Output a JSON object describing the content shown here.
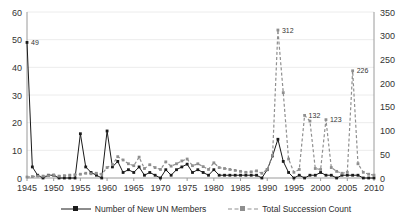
{
  "chart_data": {
    "type": "line",
    "title": "",
    "xlabel": "",
    "ylabel": "",
    "grid": true,
    "legend_position": "bottom",
    "x_axis": {
      "min": 1945,
      "max": 2010,
      "tick_step": 5,
      "tick_labels": [
        "1945",
        "1950",
        "1955",
        "1960",
        "1965",
        "1970",
        "1975",
        "1980",
        "1985",
        "1990",
        "1995",
        "2000",
        "2005",
        "2010"
      ]
    },
    "y_axis_left": {
      "min": 0,
      "max": 60,
      "tick_step": 10,
      "tick_labels": [
        "0",
        "10",
        "20",
        "30",
        "40",
        "50",
        "60"
      ],
      "series_name": "Number of New UN Members"
    },
    "y_axis_right": {
      "min": 0,
      "max": 350,
      "tick_step": 50,
      "tick_labels": [
        "0",
        "50",
        "100",
        "150",
        "200",
        "250",
        "300",
        "350"
      ],
      "series_name": "Total Succession Count"
    },
    "x": [
      1945,
      1946,
      1947,
      1948,
      1949,
      1950,
      1951,
      1952,
      1953,
      1954,
      1955,
      1956,
      1957,
      1958,
      1959,
      1960,
      1961,
      1962,
      1963,
      1964,
      1965,
      1966,
      1967,
      1968,
      1969,
      1970,
      1971,
      1972,
      1973,
      1974,
      1975,
      1976,
      1977,
      1978,
      1979,
      1980,
      1981,
      1982,
      1983,
      1984,
      1985,
      1986,
      1987,
      1988,
      1989,
      1990,
      1991,
      1992,
      1993,
      1994,
      1995,
      1996,
      1997,
      1998,
      1999,
      2000,
      2001,
      2002,
      2003,
      2004,
      2005,
      2006,
      2007,
      2008,
      2009,
      2010
    ],
    "series": [
      {
        "name": "Number of New UN Members",
        "axis": "left",
        "color": "#1a1a1a",
        "style": "solid",
        "marker": "square",
        "values": [
          49,
          4,
          1,
          0,
          1,
          1,
          0,
          0,
          0,
          0,
          16,
          4,
          2,
          1,
          0,
          17,
          4,
          6,
          2,
          3,
          2,
          4,
          1,
          2,
          1,
          0,
          3,
          1,
          3,
          4,
          5,
          2,
          3,
          2,
          1,
          3,
          1,
          1,
          1,
          1,
          1,
          1,
          1,
          1,
          0,
          3,
          8,
          14,
          6,
          2,
          0,
          1,
          0,
          1,
          1,
          2,
          1,
          1,
          0,
          1,
          1,
          1,
          1,
          0,
          0,
          0
        ]
      },
      {
        "name": "Total Succession Count",
        "axis": "right",
        "color": "#8f8f8f",
        "style": "dashed",
        "marker": "square",
        "values": [
          2,
          3,
          4,
          4,
          5,
          6,
          4,
          5,
          6,
          7,
          8,
          10,
          9,
          10,
          8,
          22,
          28,
          45,
          38,
          30,
          26,
          44,
          20,
          28,
          22,
          18,
          34,
          25,
          30,
          36,
          40,
          26,
          30,
          24,
          18,
          32,
          22,
          20,
          18,
          16,
          14,
          12,
          13,
          15,
          10,
          18,
          48,
          312,
          180,
          40,
          12,
          18,
          132,
          120,
          20,
          18,
          123,
          22,
          14,
          10,
          12,
          226,
          30,
          12,
          8,
          6
        ]
      }
    ],
    "point_labels": [
      {
        "series": "Number of New UN Members",
        "x": 1945,
        "text": "49"
      },
      {
        "series": "Total Succession Count",
        "x": 1992,
        "text": "312"
      },
      {
        "series": "Total Succession Count",
        "x": 1997,
        "text": "132"
      },
      {
        "series": "Total Succession Count",
        "x": 2001,
        "text": "123"
      },
      {
        "series": "Total Succession Count",
        "x": 2006,
        "text": "226"
      }
    ]
  },
  "legend": {
    "items": [
      {
        "label": "Number of New UN Members",
        "color": "#1a1a1a",
        "style": "solid"
      },
      {
        "label": "Total Succession Count",
        "color": "#8f8f8f",
        "style": "dashed"
      }
    ]
  }
}
